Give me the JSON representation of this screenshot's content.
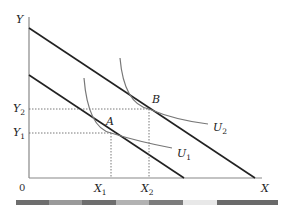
{
  "diagram": {
    "type": "indifference-curve-budget-line",
    "axes": {
      "y_label": "Y",
      "x_label": "X",
      "origin_label": "0"
    },
    "points": [
      {
        "label": "A",
        "x_label": "X",
        "x_sub": "1",
        "y_label": "Y",
        "y_sub": "1"
      },
      {
        "label": "B",
        "x_label": "X",
        "x_sub": "2",
        "y_label": "Y",
        "y_sub": "2"
      }
    ],
    "curves": [
      {
        "label": "U",
        "sub": "1"
      },
      {
        "label": "U",
        "sub": "2"
      }
    ],
    "budget_lines": [
      "inner",
      "outer"
    ]
  },
  "colors": {
    "axis": "#777777",
    "budget_line": "#222222",
    "indifference_curve": "#777777",
    "guide": "#555555",
    "strip": [
      "#6e6e6e",
      "#9a9a9a",
      "#6e6e6e",
      "#b2b2b2",
      "#7c7c7c",
      "#e8e8e8",
      "#6a6a6a"
    ]
  }
}
